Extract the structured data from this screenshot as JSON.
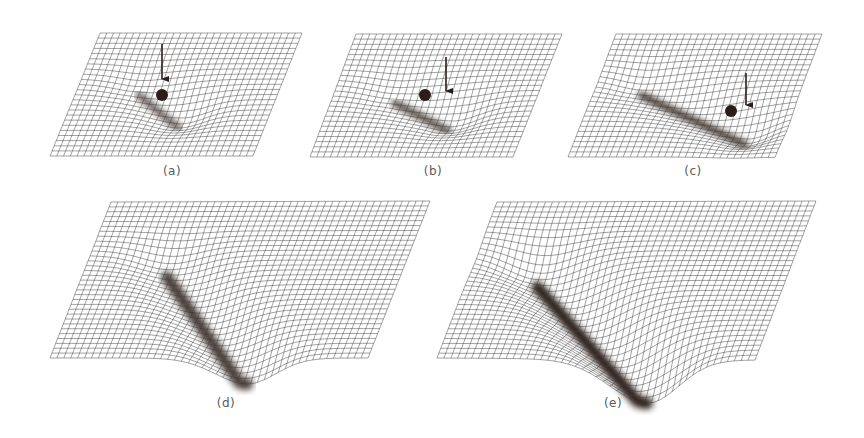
{
  "figure": {
    "colors": {
      "background": "#ffffff",
      "mesh": "#3a3a3a",
      "shadow": "#2a1a18",
      "ball": "#2b1d1b",
      "label": "#5a5a5a"
    },
    "panels": [
      {
        "id": "a",
        "label": "(a)",
        "label_pos": [
          172,
          173
        ],
        "corners": {
          "tl": [
            100,
            33
          ],
          "tr": [
            302,
            33
          ],
          "bl": [
            50,
            156
          ],
          "br": [
            253,
            156
          ]
        },
        "rows": 24,
        "cols": 30,
        "valley": {
          "start": [
            0.3,
            0.4
          ],
          "end": [
            0.55,
            0.62
          ],
          "depth": 14,
          "width": 0.12,
          "darkness": 0.75
        },
        "ball": {
          "x": 162,
          "y": 95,
          "r": 6
        },
        "arrow": {
          "x": 162,
          "y1": 44,
          "y2": 87
        }
      },
      {
        "id": "b",
        "label": "(b)",
        "label_pos": [
          433,
          173
        ],
        "corners": {
          "tl": [
            356,
            34
          ],
          "tr": [
            562,
            34
          ],
          "bl": [
            310,
            157
          ],
          "br": [
            513,
            157
          ]
        },
        "rows": 24,
        "cols": 30,
        "valley": {
          "start": [
            0.3,
            0.45
          ],
          "end": [
            0.6,
            0.62
          ],
          "depth": 16,
          "width": 0.13,
          "darkness": 0.85
        },
        "ball": {
          "x": 425,
          "y": 95,
          "r": 6
        },
        "arrow": {
          "x": 446,
          "y1": 57,
          "y2": 99
        }
      },
      {
        "id": "c",
        "label": "(c)",
        "label_pos": [
          693,
          173
        ],
        "corners": {
          "tl": [
            616,
            34
          ],
          "tr": [
            822,
            34
          ],
          "bl": [
            568,
            157
          ],
          "br": [
            775,
            157
          ]
        },
        "rows": 24,
        "cols": 30,
        "valley": {
          "start": [
            0.22,
            0.38
          ],
          "end": [
            0.8,
            0.72
          ],
          "depth": 18,
          "width": 0.12,
          "darkness": 0.95
        },
        "ball": {
          "x": 731,
          "y": 111,
          "r": 6
        },
        "arrow": {
          "x": 746,
          "y1": 73,
          "y2": 113
        }
      },
      {
        "id": "d",
        "label": "(d)",
        "label_pos": [
          226,
          405
        ],
        "corners": {
          "tl": [
            111,
            202
          ],
          "tr": [
            430,
            201
          ],
          "bl": [
            50,
            358
          ],
          "br": [
            368,
            358
          ]
        },
        "rows": 32,
        "cols": 46,
        "valley": {
          "start": [
            0.25,
            0.35
          ],
          "end": [
            0.62,
            1.0
          ],
          "depth": 26,
          "width": 0.09,
          "darkness": 0.85
        },
        "ball": null,
        "arrow": null
      },
      {
        "id": "e",
        "label": "(e)",
        "label_pos": [
          613,
          405
        ],
        "corners": {
          "tl": [
            497,
            202
          ],
          "tr": [
            816,
            201
          ],
          "bl": [
            437,
            358
          ],
          "br": [
            755,
            360
          ]
        },
        "rows": 32,
        "cols": 46,
        "valley": {
          "start": [
            0.2,
            0.35
          ],
          "end": [
            0.66,
            1.0
          ],
          "depth": 44,
          "width": 0.1,
          "darkness": 1.0
        },
        "ball": null,
        "arrow": null
      }
    ]
  }
}
